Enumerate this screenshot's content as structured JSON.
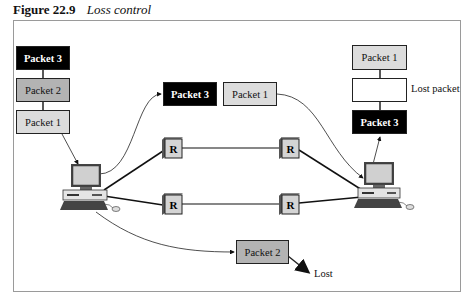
{
  "caption": {
    "number": "Figure 22.9",
    "title": "Loss control"
  },
  "sender_stack": [
    {
      "label": "Packet 3",
      "style": "black"
    },
    {
      "label": "Packet 2",
      "style": "dark"
    },
    {
      "label": "Packet 1",
      "style": "light"
    }
  ],
  "in_transit": [
    {
      "label": "Packet 3",
      "style": "black"
    },
    {
      "label": "Packet 1",
      "style": "light"
    },
    {
      "label": "Packet 2",
      "style": "dark"
    }
  ],
  "receiver_stack": [
    {
      "label": "Packet 1",
      "style": "light"
    },
    {
      "label": "",
      "style": "empty"
    },
    {
      "label": "Packet 3",
      "style": "black"
    }
  ],
  "labels": {
    "lost_packet": "Lost packet",
    "lost": "Lost"
  },
  "routers": [
    {
      "label": "R"
    },
    {
      "label": "R"
    },
    {
      "label": "R"
    },
    {
      "label": "R"
    }
  ],
  "colors": {
    "black_packet": "#000000",
    "dark_packet": "#b3b3b3",
    "light_packet": "#dcdcdc",
    "router": "#d4d4d4"
  }
}
